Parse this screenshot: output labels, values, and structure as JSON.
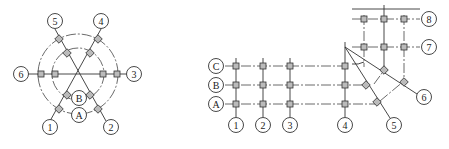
{
  "figure_left": {
    "title": "radial grid",
    "axis_labels": {
      "l1": "1",
      "l2": "2",
      "l3": "3",
      "l4": "4",
      "l5": "5",
      "l6": "6",
      "lA": "A",
      "lB": "B"
    }
  },
  "figure_right": {
    "title": "orthogonal and skewed grid",
    "row_labels": {
      "C": "C",
      "B": "B",
      "A": "A"
    },
    "col_labels": {
      "c1": "1",
      "c2": "2",
      "c3": "3",
      "c4": "4",
      "c5": "5",
      "c6": "6",
      "c7": "7",
      "c8": "8"
    }
  }
}
